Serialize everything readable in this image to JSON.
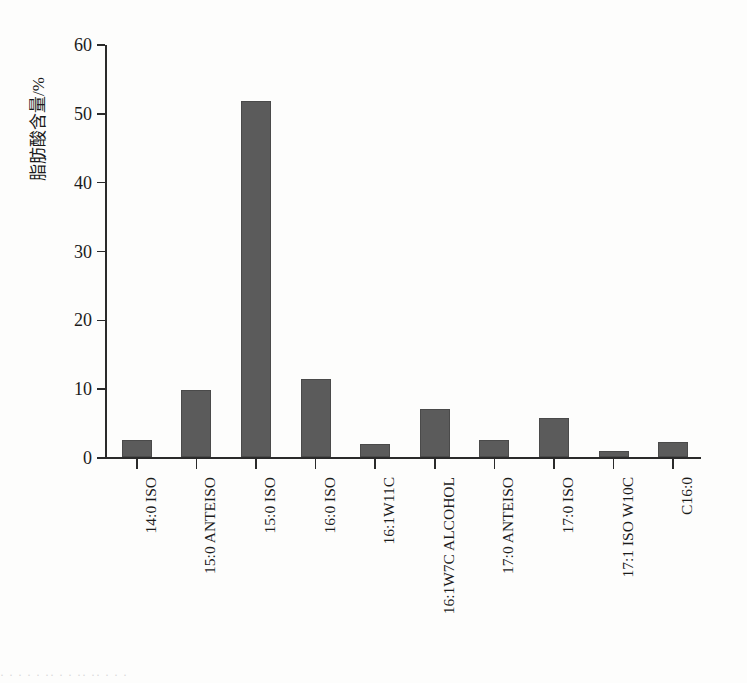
{
  "chart_data": {
    "type": "bar",
    "title": "",
    "subtitle": "",
    "xlabel": "",
    "ylabel": "脂肪酸含量/%",
    "ylim": [
      0,
      60
    ],
    "yticks": [
      0,
      10,
      20,
      30,
      40,
      50,
      60
    ],
    "ytick_labels": [
      "0",
      "10",
      "20",
      "30",
      "40",
      "50",
      "60"
    ],
    "grid": false,
    "legend": null,
    "bar_color": "#5b5b5b",
    "axis_color": "#2a2a2a",
    "background_color": "#fdfdfc",
    "categories": [
      "14:0 ISO",
      "15:0 ANTEISO",
      "15:0 ISO",
      "16:0 ISO",
      "16:1W11C",
      "16:1W7C ALCOHOL",
      "17:0 ANTEISO",
      "17:0 ISO",
      "17:1 ISO W10C",
      "C16:0"
    ],
    "values": [
      2.4,
      9.8,
      51.7,
      11.3,
      1.9,
      7.0,
      2.5,
      5.7,
      0.9,
      2.2
    ],
    "series": [
      {
        "name": "脂肪酸含量",
        "values": [
          2.4,
          9.8,
          51.7,
          11.3,
          1.9,
          7.0,
          2.5,
          5.7,
          0.9,
          2.2
        ]
      }
    ]
  },
  "figure": {
    "scan_artifact_text": "· ·  · ·   ·  ·· ·   ·  ·· ·· ·    ·  ·"
  }
}
